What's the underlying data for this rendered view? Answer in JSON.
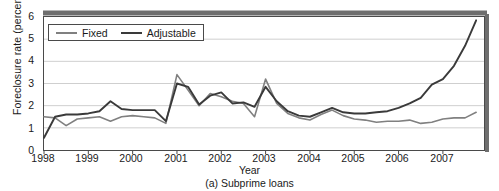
{
  "chart_data": {
    "type": "line",
    "title": "",
    "caption": "(a) Subprime loans",
    "xlabel": "Year",
    "ylabel": "Foreclosure rate (percentage)",
    "xlim": [
      1998.0,
      2007.95
    ],
    "ylim": [
      0,
      6
    ],
    "yticks": [
      0,
      1,
      2,
      3,
      4,
      5,
      6
    ],
    "xticks": [
      1998,
      1999,
      2000,
      2001,
      2002,
      2003,
      2004,
      2005,
      2006,
      2007
    ],
    "grid": "horizontal",
    "legend_position": "top-left-inside",
    "series": [
      {
        "name": "Fixed",
        "color": "#808080",
        "x": [
          1998.0,
          1998.25,
          1998.5,
          1998.75,
          1999.0,
          1999.25,
          1999.5,
          1999.75,
          2000.0,
          2000.25,
          2000.5,
          2000.75,
          2001.0,
          2001.25,
          2001.5,
          2001.75,
          2002.0,
          2002.25,
          2002.5,
          2002.75,
          2003.0,
          2003.25,
          2003.5,
          2003.75,
          2004.0,
          2004.25,
          2004.5,
          2004.75,
          2005.0,
          2005.25,
          2005.5,
          2005.75,
          2006.0,
          2006.25,
          2006.5,
          2006.75,
          2007.0,
          2007.25,
          2007.5,
          2007.75
        ],
        "values": [
          1.5,
          1.45,
          1.1,
          1.4,
          1.45,
          1.5,
          1.3,
          1.5,
          1.55,
          1.5,
          1.45,
          1.2,
          3.4,
          2.7,
          2.0,
          2.55,
          2.4,
          2.2,
          2.1,
          1.5,
          3.2,
          2.1,
          1.65,
          1.45,
          1.35,
          1.6,
          1.8,
          1.55,
          1.4,
          1.35,
          1.25,
          1.3,
          1.3,
          1.35,
          1.2,
          1.25,
          1.4,
          1.45,
          1.45,
          1.7
        ]
      },
      {
        "name": "Adjustable",
        "color": "#3a3a3a",
        "x": [
          1998.0,
          1998.25,
          1998.5,
          1998.75,
          1999.0,
          1999.25,
          1999.5,
          1999.75,
          2000.0,
          2000.25,
          2000.5,
          2000.75,
          2001.0,
          2001.25,
          2001.5,
          2001.75,
          2002.0,
          2002.25,
          2002.5,
          2002.75,
          2003.0,
          2003.25,
          2003.5,
          2003.75,
          2004.0,
          2004.25,
          2004.5,
          2004.75,
          2005.0,
          2005.25,
          2005.5,
          2005.75,
          2006.0,
          2006.25,
          2006.5,
          2006.75,
          2007.0,
          2007.25,
          2007.5,
          2007.75
        ],
        "values": [
          0.55,
          1.5,
          1.6,
          1.6,
          1.65,
          1.75,
          2.2,
          1.85,
          1.8,
          1.8,
          1.8,
          1.3,
          3.0,
          2.85,
          2.05,
          2.45,
          2.6,
          2.1,
          2.15,
          1.95,
          2.85,
          2.2,
          1.75,
          1.55,
          1.5,
          1.7,
          1.9,
          1.7,
          1.65,
          1.65,
          1.7,
          1.75,
          1.9,
          2.1,
          2.35,
          2.95,
          3.2,
          3.8,
          4.7,
          5.85
        ]
      }
    ]
  },
  "legend": {
    "items": [
      {
        "label": "Fixed"
      },
      {
        "label": "Adjustable"
      }
    ]
  },
  "axis": {
    "y_tick_labels": [
      "6",
      "5",
      "4",
      "3",
      "2",
      "1",
      "0"
    ],
    "x_tick_labels": [
      "1998",
      "1999",
      "2000",
      "2001",
      "2002",
      "2003",
      "2004",
      "2005",
      "2006",
      "2007"
    ]
  }
}
